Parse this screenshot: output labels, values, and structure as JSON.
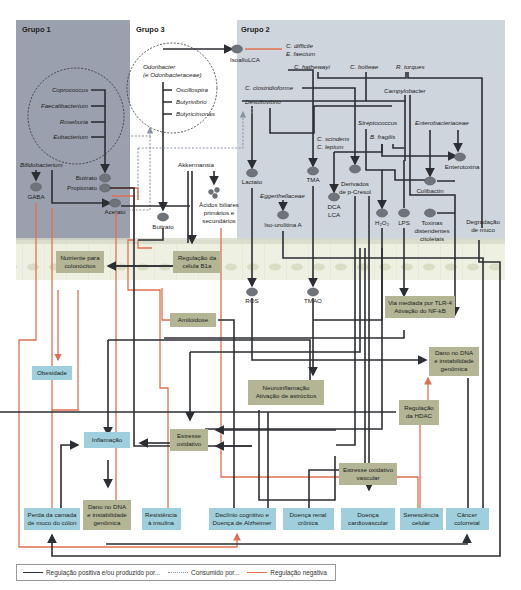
{
  "groups": [
    {
      "id": "g1",
      "title": "Grupo 1",
      "bg": "#9aa0ad"
    },
    {
      "id": "g3",
      "title": "Grupo 3",
      "bg": "#ffffff"
    },
    {
      "id": "g2",
      "title": "Grupo 2",
      "bg": "#cfd5dd"
    }
  ],
  "bacteria": {
    "g1_circle": [
      "Coprococcus",
      "Faecalibacterium",
      "Roseburia",
      "Eubacterium"
    ],
    "bifido": "Bifidobacterium",
    "g3_circle_title_1": "Odoribacter",
    "g3_circle_title_2": "(e Odoribacteraceae)",
    "g3_circle": [
      "Oscillospira",
      "Butyrivibrio",
      "Butyricimonas"
    ],
    "akkermansia": "Akkermansia",
    "cdiff": "C. difficile",
    "efaec": "E. faecium",
    "chath": "C. hathewayi",
    "cbolt": "C. bolteae",
    "rtorq": "R. torques",
    "cclos": "C. clostridioforme",
    "desulfo": "Desulfovibrio",
    "campy": "Campylobacter",
    "strep": "Streptococcus",
    "bfrag": "B. fragilis",
    "entero": "Enterobacteriaceae",
    "cscin": "C. scindens",
    "clept": "C. leptum",
    "egger": "Eggerthellaceae"
  },
  "metabolites": {
    "gaba": "GABA",
    "butirato1": "Butirato",
    "propionato": "Propionato",
    "acetato": "Acetato",
    "butirato3": "Butirato",
    "isoallolca": "IsoalloLCA",
    "acidos_1": "Ácidos biliares",
    "acidos_2": "primários e",
    "acidos_3": "secundários",
    "lactato": "Lactato",
    "tma": "TMA",
    "pcresol_1": "Derivados",
    "pcresol_2": "de p-Cresol",
    "dca": "DCA",
    "lca": "LCA",
    "h2o2": "H₂O₂",
    "lps": "LPS",
    "enterotoxina": "Enterotoxina",
    "colibactin": "Colibactin",
    "toxinas_1": "Toxinas",
    "toxinas_2": "distendentes",
    "toxinas_3": "citoletais",
    "degradacao_1": "Degradação",
    "degradacao_2": "de muco",
    "isourolitina": "Iso-urolitina A",
    "ros": "ROS",
    "tmao": "TMAO"
  },
  "mechanisms": {
    "nutriente": [
      "Nutriente para",
      "colonócitos"
    ],
    "regulacao_b1a": [
      "Regulação da",
      "célula B1a"
    ],
    "amiloidose": [
      "Amiloidose"
    ],
    "tlr4": [
      "Via mediada por TLR-4",
      "Ativação do NF-kB"
    ],
    "dano_dna_right": [
      "Dano no DNA",
      "e instabilidade",
      "genômica"
    ],
    "neuroinflamacao": [
      "Neuroinflamação",
      "Ativação de astrócitos"
    ],
    "hdac": [
      "Regulação",
      "da HDAC"
    ],
    "estresse_oxidativo": [
      "Estresse",
      "oxidativo"
    ],
    "estresse_vascular": [
      "Estresse oxidativo",
      "vascular"
    ],
    "dano_dna_left": [
      "Dano no DNA",
      "e instabilidade",
      "genômica"
    ]
  },
  "outcomes": {
    "obesidade": [
      "Obesidade"
    ],
    "inflamacao": [
      "Inflamação"
    ],
    "perda_muco": [
      "Perda da camada",
      "de muco do cólon"
    ],
    "resistencia": [
      "Resistência",
      "à insulina"
    ],
    "declinio": [
      "Declínio cognitivo e",
      "Doença de Alzheimer"
    ],
    "renal": [
      "Doença renal",
      "crônica"
    ],
    "cardio": [
      "Doença",
      "cardiovascular"
    ],
    "senescencia": [
      "Senescência",
      "celular"
    ],
    "cancer": [
      "Câncer",
      "colorretal"
    ]
  },
  "legend": {
    "positive": "Regulação positiva e/ou produzido por...",
    "consumed": "Consumido por...",
    "negative": "Regulação negativa"
  },
  "colors": {
    "group1_bg": "#9aa0ad",
    "group2_bg": "#cfd5dd",
    "epithelium": "#e6ead8",
    "mechanism_box": "#b3b594",
    "outcome_box": "#9fcfdc",
    "positive_line": "#2b2e33",
    "negative_line": "#e07050",
    "consumed_line": "#8a93a6"
  }
}
